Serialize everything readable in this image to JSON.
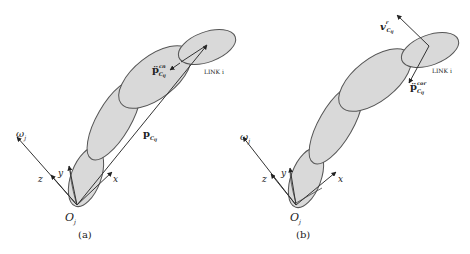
{
  "figure": {
    "panel_a": {
      "caption": "(a)",
      "origin_label": "O",
      "origin_sub": "j",
      "omega_label": "ω",
      "omega_sub": "j",
      "axis_z": "z",
      "axis_y": "y",
      "axis_x": "x",
      "position_vector_label": "p",
      "position_vector_sub": "C",
      "position_vector_subsub": "ij",
      "accel_label": "p̈",
      "accel_sup": "cn",
      "accel_sub": "C",
      "accel_subsub": "ij",
      "link_label": "LINK i"
    },
    "panel_b": {
      "caption": "(b)",
      "origin_label": "O",
      "origin_sub": "j",
      "omega_label": "ω",
      "omega_sub": "j",
      "axis_z": "z",
      "axis_y": "y",
      "axis_x": "x",
      "velocity_label": "v",
      "velocity_sup": "r",
      "velocity_sub": "C",
      "velocity_subsub": "ij",
      "accel_label": "p̈",
      "accel_sup": "cor",
      "accel_sub": "C",
      "accel_subsub": "ij",
      "link_label": "LINK i"
    },
    "colors": {
      "link_fill": "#d9d9d9",
      "link_stroke": "#555555",
      "line": "#333333"
    }
  }
}
